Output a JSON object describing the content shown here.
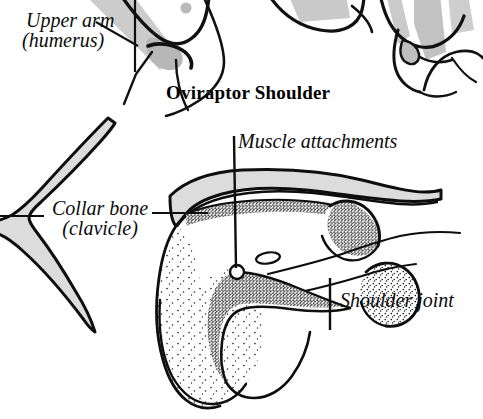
{
  "figure": {
    "title": "Oviraptor Shoulder",
    "background_color": "#ffffff",
    "ink_color": "#0b0b0b",
    "bone_fill_color": "#dcdcdc",
    "stipple_color": "#1a1a1a"
  },
  "labels": {
    "upper_arm": {
      "line1": "Upper arm",
      "line2": "(humerus)",
      "name": "upper-arm-humerus"
    },
    "collar_bone": {
      "line1": "Collar bone",
      "line2": "(clavicle)",
      "name": "collar-bone-clavicle"
    },
    "muscle_attachments": {
      "line1": "Muscle attachments",
      "name": "muscle-attachments"
    },
    "shoulder_joint": {
      "line1": "Shoulder joint",
      "name": "shoulder-joint"
    }
  },
  "icons": {
    "leader_line": "leader-line-icon",
    "joint_socket": "joint-socket-icon",
    "foramen": "foramen-icon"
  }
}
